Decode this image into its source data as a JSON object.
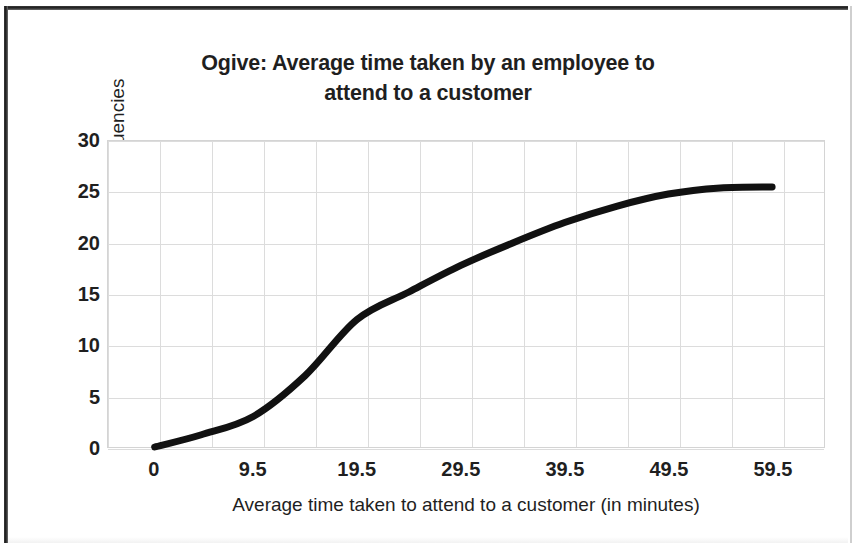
{
  "chart_data": {
    "type": "line",
    "title": "Ogive: Average time taken by an employee to attend to a customer",
    "title_line1": "Ogive: Average time taken by an employee to",
    "title_line2": "attend to a customer",
    "xlabel": "Average time taken to attend to a customer (in minutes)",
    "ylabel": "Cumulative Frequencies",
    "x_tick_labels": [
      "0",
      "9.5",
      "19.5",
      "29.5",
      "39.5",
      "49.5",
      "59.5"
    ],
    "x_tick_values": [
      0,
      9.5,
      19.5,
      29.5,
      39.5,
      49.5,
      59.5
    ],
    "y_tick_labels": [
      "0",
      "5",
      "10",
      "15",
      "20",
      "25",
      "30"
    ],
    "y_tick_values": [
      0,
      5,
      10,
      15,
      20,
      25,
      30
    ],
    "ylim": [
      0,
      30
    ],
    "xlim": [
      -4.5,
      64.5
    ],
    "grid": true,
    "legend": "none",
    "line_color": "#111111",
    "line_width": 7,
    "series": [
      {
        "name": "Cumulative frequency",
        "x": [
          0,
          4.5,
          9.5,
          14.5,
          19.5,
          24.5,
          29.5,
          34.5,
          39.5,
          44.5,
          49.5,
          54.5,
          59.5
        ],
        "values": [
          0,
          1.2,
          3.0,
          7.0,
          12.5,
          15.2,
          17.8,
          20.0,
          22.0,
          23.6,
          24.8,
          25.4,
          25.5
        ]
      }
    ]
  }
}
